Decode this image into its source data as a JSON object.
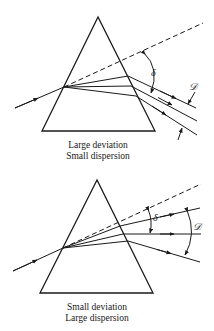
{
  "diagrams": [
    {
      "id": "top",
      "caption_line1": "Large deviation",
      "caption_line2": "Small dispersion",
      "deviation_symbol": "δ",
      "dispersion_symbol": "𝒟"
    },
    {
      "id": "bottom",
      "caption_line1": "Small deviation",
      "caption_line2": "Large dispersion",
      "deviation_symbol": "δ",
      "dispersion_symbol": "𝒟"
    }
  ],
  "colors": {
    "stroke": "#1a1a1a",
    "background": "#ffffff"
  }
}
